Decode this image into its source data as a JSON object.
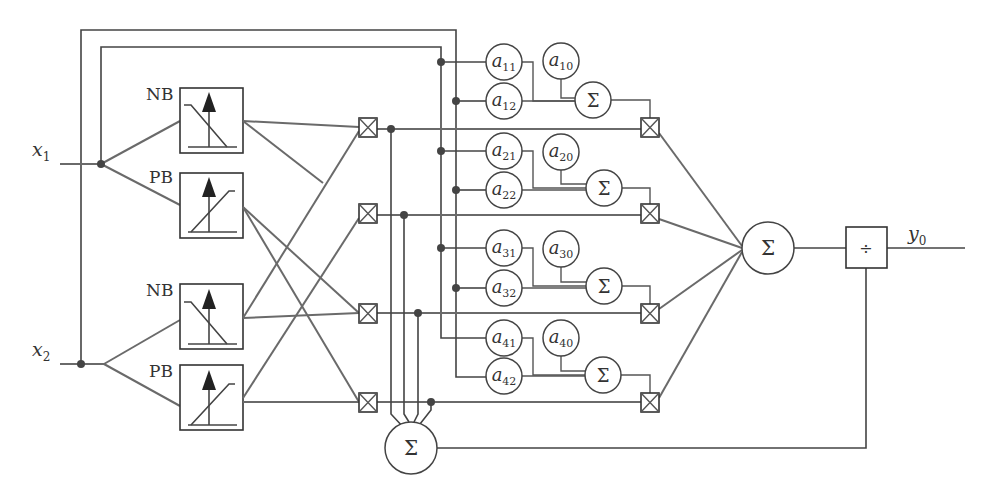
{
  "diagram": {
    "type": "ANFIS / Takagi-Sugeno fuzzy neural network block diagram",
    "inputs": [
      {
        "name": "x",
        "sub": "1"
      },
      {
        "name": "x",
        "sub": "2"
      }
    ],
    "output": {
      "name": "y",
      "sub": "0"
    },
    "membership_functions": [
      {
        "label": "NB",
        "input": "x1",
        "shape": "decreasing"
      },
      {
        "label": "PB",
        "input": "x1",
        "shape": "increasing"
      },
      {
        "label": "NB",
        "input": "x2",
        "shape": "decreasing"
      },
      {
        "label": "PB",
        "input": "x2",
        "shape": "increasing"
      }
    ],
    "rule_product_node_symbol": "⊠",
    "rules": [
      {
        "coefs": [
          {
            "n": "a",
            "s": "11"
          },
          {
            "n": "a",
            "s": "12"
          },
          {
            "n": "a",
            "s": "10"
          }
        ],
        "sum": "Σ"
      },
      {
        "coefs": [
          {
            "n": "a",
            "s": "21"
          },
          {
            "n": "a",
            "s": "22"
          },
          {
            "n": "a",
            "s": "20"
          }
        ],
        "sum": "Σ"
      },
      {
        "coefs": [
          {
            "n": "a",
            "s": "31"
          },
          {
            "n": "a",
            "s": "32"
          },
          {
            "n": "a",
            "s": "30"
          }
        ],
        "sum": "Σ"
      },
      {
        "coefs": [
          {
            "n": "a",
            "s": "41"
          },
          {
            "n": "a",
            "s": "42"
          },
          {
            "n": "a",
            "s": "40"
          }
        ],
        "sum": "Σ"
      }
    ],
    "summation_symbol": "Σ",
    "output_sum_symbol": "Σ",
    "normalizer_sum_symbol": "Σ",
    "divide_symbol": "÷"
  }
}
